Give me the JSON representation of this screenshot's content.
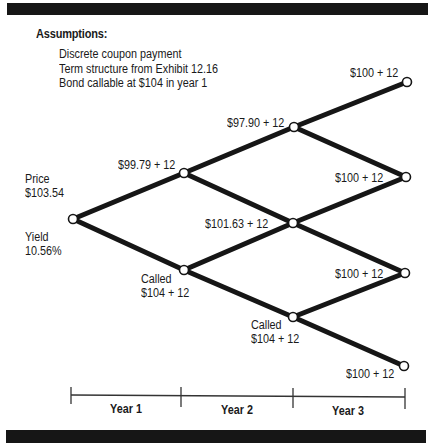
{
  "assumptions": {
    "title": "Assumptions:",
    "items": [
      "Discrete coupon payment",
      "Term structure from Exhibit 12.16",
      "Bond callable at $104 in year 1"
    ]
  },
  "root": {
    "price_label": "Price",
    "price_value": "$103.54",
    "yield_label": "Yield",
    "yield_value": "10.56%"
  },
  "nodes": {
    "y1_up": "$99.79 + 12",
    "y1_down_line1": "Called",
    "y1_down_line2": "$104 + 12",
    "y2_up": "$97.90 + 12",
    "y2_mid": "$101.63 + 12",
    "y2_down_line1": "Called",
    "y2_down_line2": "$104 + 12",
    "y3_1": "$100 + 12",
    "y3_2": "$100 + 12",
    "y3_3": "$100 + 12",
    "y3_4": "$100 + 12"
  },
  "timeline": {
    "labels": [
      "Year 1",
      "Year 2",
      "Year 3"
    ]
  },
  "colors": {
    "ink": "#161616",
    "paper": "#ffffff"
  }
}
